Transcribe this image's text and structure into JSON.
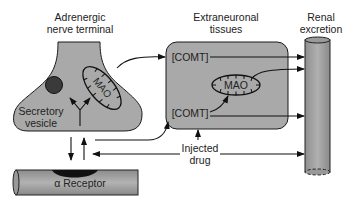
{
  "labels": {
    "nerve_terminal": [
      "Adrenergic",
      "nerve terminal"
    ],
    "extraneuronal": [
      "Extraneuronal",
      "tissues"
    ],
    "renal": [
      "Renal",
      "excretion"
    ],
    "secretory_vesicle": [
      "Secretory",
      "vesicle"
    ],
    "mao_neuronal": "MAO",
    "mao_extraneuronal": "MAO",
    "comt_top": "[COMT]",
    "comt_bottom": "[COMT]",
    "injected_drug": [
      "Injected",
      "drug"
    ],
    "receptor": "α Receptor"
  },
  "colors": {
    "fill_gray": "#a9a9a9",
    "dark": "#1a1a1a",
    "vesicle": "#3a3a3a",
    "background": "#ffffff"
  }
}
